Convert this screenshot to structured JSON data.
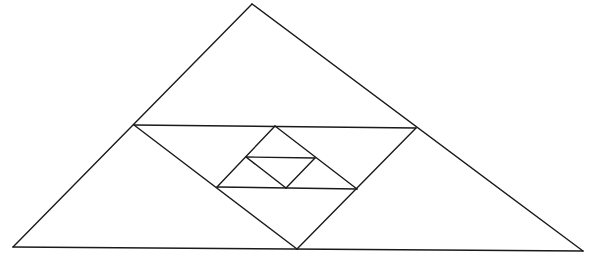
{
  "diagram": {
    "stroke_color": "#1a1a1a",
    "background": "#ffffff",
    "points": {
      "A": [
        252,
        4
      ],
      "B": [
        13,
        247
      ],
      "C": [
        583,
        251
      ],
      "M_AB": [
        134,
        125
      ],
      "M_AC": [
        416,
        128
      ],
      "M_BC": [
        297,
        249
      ],
      "P": [
        275,
        126
      ],
      "Q": [
        217,
        187
      ],
      "R": [
        357,
        189
      ],
      "M_PQ": [
        246,
        157
      ],
      "M_PR": [
        315,
        158
      ],
      "M_QR": [
        286,
        188
      ]
    },
    "segments": [
      {
        "name": "outer-left-side",
        "from": "A",
        "to": "B"
      },
      {
        "name": "outer-right-side",
        "from": "A",
        "to": "C"
      },
      {
        "name": "outer-base",
        "from": "B",
        "to": "C"
      },
      {
        "name": "medial-top",
        "from": "M_AB",
        "to": "M_AC"
      },
      {
        "name": "medial-left",
        "from": "M_AB",
        "to": "M_BC"
      },
      {
        "name": "medial-right",
        "from": "M_AC",
        "to": "M_BC"
      },
      {
        "name": "inner-left",
        "from": "P",
        "to": "Q"
      },
      {
        "name": "inner-right",
        "from": "P",
        "to": "R"
      },
      {
        "name": "inner-base",
        "from": "Q",
        "to": "R"
      },
      {
        "name": "innermost-top",
        "from": "M_PQ",
        "to": "M_PR"
      },
      {
        "name": "innermost-left",
        "from": "M_PQ",
        "to": "M_QR"
      },
      {
        "name": "innermost-right",
        "from": "M_PR",
        "to": "M_QR"
      }
    ]
  }
}
